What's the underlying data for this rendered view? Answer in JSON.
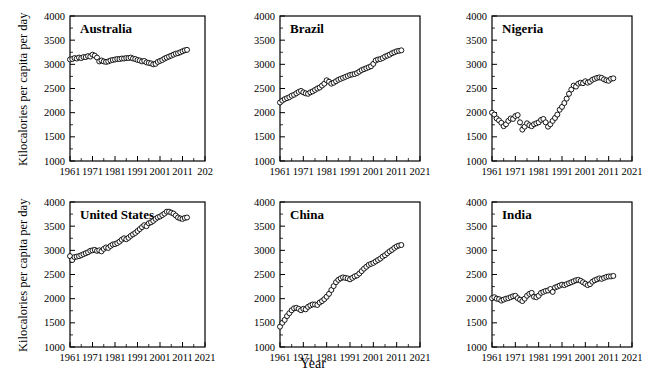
{
  "figure": {
    "xlabel": "Year",
    "ylabel": "Kilocalories per capita per day",
    "ylabel_top": "Kilocalories per capita per day",
    "ylabel_bottom": "Kilocalories per capita per day"
  },
  "chart_data": {
    "type": "line",
    "title": "",
    "xlabel": "Year",
    "ylabel": "Kilocalories per capita per day",
    "xlim": [
      1961,
      2021
    ],
    "ylim": [
      1000,
      4000
    ],
    "yticks": [
      1000,
      1500,
      2000,
      2500,
      3000,
      3500,
      4000
    ],
    "xticks": [
      1961,
      1971,
      1981,
      1991,
      2001,
      2011,
      2021
    ],
    "grid": false,
    "legend": "none",
    "marker": "open-circle",
    "panel_layout": "2 rows x 3 columns",
    "x": [
      1961,
      1962,
      1963,
      1964,
      1965,
      1966,
      1967,
      1968,
      1969,
      1970,
      1971,
      1972,
      1973,
      1974,
      1975,
      1976,
      1977,
      1978,
      1979,
      1980,
      1981,
      1982,
      1983,
      1984,
      1985,
      1986,
      1987,
      1988,
      1989,
      1990,
      1991,
      1992,
      1993,
      1994,
      1995,
      1996,
      1997,
      1998,
      1999,
      2000,
      2001,
      2002,
      2003,
      2004,
      2005,
      2006,
      2007,
      2008,
      2009,
      2010,
      2011,
      2012,
      2013
    ],
    "panels": [
      {
        "name": "Australia",
        "xticklabels": [
          "1961",
          "1971",
          "1981",
          "1991",
          "2001",
          "2011",
          "202"
        ],
        "values": [
          3100,
          3110,
          3130,
          3120,
          3140,
          3130,
          3150,
          3150,
          3170,
          3160,
          3200,
          3180,
          3140,
          3060,
          3080,
          3060,
          3050,
          3060,
          3080,
          3090,
          3100,
          3110,
          3110,
          3120,
          3120,
          3130,
          3130,
          3140,
          3120,
          3110,
          3090,
          3080,
          3060,
          3070,
          3040,
          3030,
          3020,
          3000,
          3010,
          3050,
          3070,
          3090,
          3120,
          3140,
          3160,
          3180,
          3200,
          3220,
          3230,
          3250,
          3270,
          3290,
          3300
        ]
      },
      {
        "name": "Brazil",
        "xticklabels": [
          "1961",
          "1971",
          "1981",
          "1991",
          "2001",
          "2011",
          "2021"
        ],
        "values": [
          2210,
          2250,
          2280,
          2300,
          2320,
          2350,
          2370,
          2400,
          2430,
          2450,
          2420,
          2400,
          2390,
          2420,
          2440,
          2470,
          2500,
          2520,
          2560,
          2600,
          2670,
          2640,
          2600,
          2620,
          2650,
          2680,
          2700,
          2720,
          2740,
          2760,
          2780,
          2790,
          2800,
          2820,
          2850,
          2880,
          2900,
          2920,
          2940,
          2960,
          3010,
          3080,
          3100,
          3110,
          3130,
          3160,
          3180,
          3200,
          3230,
          3250,
          3270,
          3280,
          3290
        ]
      },
      {
        "name": "Nigeria",
        "xticklabels": [
          "1961",
          "1971",
          "1981",
          "1991",
          "2001",
          "2011",
          "2021"
        ],
        "values": [
          2000,
          1960,
          1880,
          1840,
          1790,
          1720,
          1760,
          1830,
          1880,
          1870,
          1930,
          1950,
          1800,
          1650,
          1710,
          1780,
          1740,
          1720,
          1760,
          1780,
          1800,
          1850,
          1870,
          1800,
          1710,
          1760,
          1830,
          1890,
          1960,
          2060,
          2120,
          2200,
          2290,
          2390,
          2480,
          2560,
          2540,
          2600,
          2620,
          2610,
          2650,
          2620,
          2640,
          2680,
          2700,
          2720,
          2730,
          2720,
          2690,
          2670,
          2660,
          2700,
          2710
        ]
      },
      {
        "name": "United States",
        "xticklabels": [
          "1961",
          "1971",
          "1981",
          "1991",
          "2001",
          "2011",
          "2021"
        ],
        "values": [
          2880,
          2800,
          2860,
          2870,
          2880,
          2900,
          2920,
          2940,
          2960,
          2990,
          3000,
          3010,
          2990,
          3000,
          2980,
          3030,
          3060,
          3050,
          3090,
          3120,
          3130,
          3150,
          3180,
          3220,
          3250,
          3230,
          3260,
          3300,
          3330,
          3360,
          3400,
          3440,
          3480,
          3520,
          3500,
          3560,
          3580,
          3610,
          3650,
          3680,
          3700,
          3730,
          3760,
          3800,
          3800,
          3780,
          3760,
          3720,
          3680,
          3660,
          3650,
          3670,
          3680
        ]
      },
      {
        "name": "China",
        "xticklabels": [
          "1961",
          "1971",
          "1981",
          "1991",
          "2001",
          "2011",
          "2021"
        ],
        "values": [
          1420,
          1500,
          1560,
          1640,
          1700,
          1760,
          1800,
          1810,
          1790,
          1760,
          1790,
          1780,
          1830,
          1860,
          1880,
          1880,
          1870,
          1920,
          1950,
          1990,
          2040,
          2100,
          2180,
          2260,
          2340,
          2390,
          2420,
          2440,
          2430,
          2420,
          2400,
          2430,
          2460,
          2480,
          2520,
          2570,
          2620,
          2660,
          2700,
          2720,
          2740,
          2770,
          2800,
          2830,
          2870,
          2900,
          2940,
          2980,
          3010,
          3050,
          3080,
          3100,
          3110
        ]
      },
      {
        "name": "India",
        "xticklabels": [
          "1961",
          "1971",
          "1981",
          "1991",
          "2001",
          "2011",
          "2021"
        ],
        "values": [
          2010,
          2030,
          2000,
          1990,
          1960,
          1980,
          2000,
          2010,
          2030,
          2050,
          2060,
          2010,
          1980,
          1950,
          2000,
          2060,
          2100,
          2120,
          2040,
          2030,
          2060,
          2120,
          2140,
          2160,
          2170,
          2200,
          2140,
          2230,
          2250,
          2270,
          2290,
          2280,
          2300,
          2320,
          2340,
          2360,
          2380,
          2390,
          2370,
          2340,
          2310,
          2280,
          2300,
          2350,
          2380,
          2400,
          2420,
          2410,
          2430,
          2450,
          2460,
          2460,
          2470
        ]
      }
    ]
  }
}
